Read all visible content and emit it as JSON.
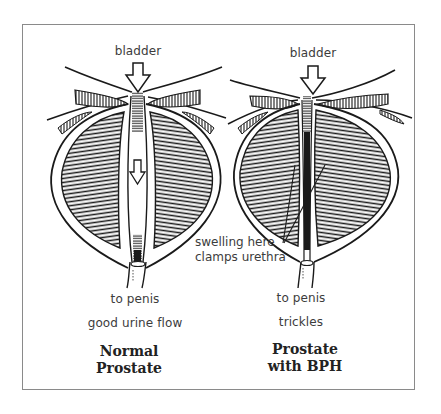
{
  "diagram": {
    "panels": [
      {
        "id": "normal",
        "top_label": "bladder",
        "bottom_label": "to penis",
        "flow_label": "good urine flow",
        "title_line1": "Normal",
        "title_line2": "Prostate"
      },
      {
        "id": "bph",
        "top_label": "bladder",
        "bottom_label": "to penis",
        "flow_label": "trickles",
        "title_line1": "Prostate",
        "title_line2": "with BPH",
        "annotation_line1": "swelling here",
        "annotation_line2": "clamps urethra"
      }
    ],
    "colors": {
      "ink": "#1a1a1a",
      "frame": "#8a8a8a",
      "text": "#3c3c3c"
    }
  }
}
